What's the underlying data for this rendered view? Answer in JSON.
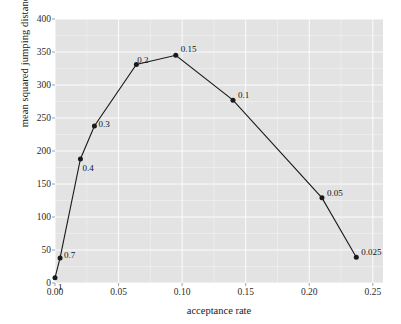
{
  "chart_data": {
    "type": "line",
    "title": "",
    "xlabel": "acceptance rate",
    "ylabel": "mean squared jumping distance",
    "xlim": [
      0.0,
      0.258
    ],
    "ylim": [
      0,
      400
    ],
    "grid": true,
    "legend": null,
    "xticks": [
      "0.00",
      "0.05",
      "0.10",
      "0.15",
      "0.20",
      "0.25"
    ],
    "xtick_values": [
      0.0,
      0.05,
      0.1,
      0.15,
      0.2,
      0.25
    ],
    "yticks": [
      "0",
      "50",
      "100",
      "150",
      "200",
      "250",
      "300",
      "350",
      "400"
    ],
    "ytick_values": [
      0,
      50,
      100,
      150,
      200,
      250,
      300,
      350,
      400
    ],
    "series": [
      {
        "name": "proposal scale",
        "marker": "filled-circle",
        "color": "#1a1a1a",
        "points": [
          {
            "label": "1",
            "x": 0.0,
            "y": 8
          },
          {
            "label": "0.7",
            "x": 0.004,
            "y": 38
          },
          {
            "label": "0.4",
            "x": 0.02,
            "y": 188
          },
          {
            "label": "0.3",
            "x": 0.031,
            "y": 238
          },
          {
            "label": "0.2",
            "x": 0.064,
            "y": 331
          },
          {
            "label": "0.15",
            "x": 0.095,
            "y": 345
          },
          {
            "label": "0.1",
            "x": 0.14,
            "y": 277
          },
          {
            "label": "0.05",
            "x": 0.21,
            "y": 129
          },
          {
            "label": "0.025",
            "x": 0.237,
            "y": 39
          }
        ]
      }
    ]
  },
  "axes": {
    "x_title": "acceptance rate",
    "y_title": "mean squared jumping distance"
  }
}
